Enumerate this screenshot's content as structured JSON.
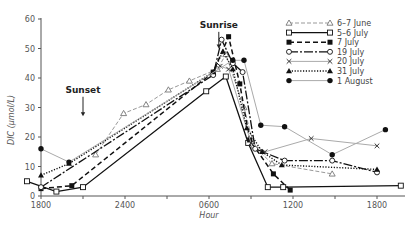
{
  "chart_data": {
    "type": "line",
    "title": "",
    "xlabel": "Hour",
    "ylabel": "DIC (µmol/L)",
    "ylim": [
      0,
      60
    ],
    "yticks": [
      0,
      10,
      20,
      30,
      40,
      50,
      60
    ],
    "x_unit": "hours elapsed since 1800",
    "xlim": [
      0,
      26
    ],
    "xticks": [
      {
        "x": 0,
        "label": "1800"
      },
      {
        "x": 3,
        "label": ""
      },
      {
        "x": 6,
        "label": "2400"
      },
      {
        "x": 9,
        "label": ""
      },
      {
        "x": 12,
        "label": "0600"
      },
      {
        "x": 15,
        "label": ""
      },
      {
        "x": 18,
        "label": "1200"
      },
      {
        "x": 21,
        "label": ""
      },
      {
        "x": 24,
        "label": "1800"
      }
    ],
    "grid": false,
    "legend_position": "upper right",
    "annotations": [
      {
        "text": "Sunset",
        "x": 3.0,
        "y_text": 35,
        "arrow_to": 27
      },
      {
        "text": "Sunrise",
        "x": 12.7,
        "y_text": 57,
        "arrow_to": 50
      }
    ],
    "series": [
      {
        "name": "6–7 June",
        "marker": "open-triangle",
        "line": "dashed-light",
        "color": "#999999",
        "x": [
          3.9,
          5.9,
          7.5,
          9.1,
          10.6,
          12.6,
          13.2,
          14.5,
          15.2,
          16.5,
          20.8
        ],
        "y": [
          14,
          28,
          31,
          36,
          39,
          43,
          48,
          30,
          17,
          11,
          7.5
        ]
      },
      {
        "name": "5–6 July",
        "marker": "open-square",
        "line": "solid",
        "color": "#111111",
        "x": [
          -1.0,
          1.1,
          3.0,
          11.8,
          13.2,
          14.8,
          16.2,
          17.3,
          25.7
        ],
        "y": [
          5,
          1.5,
          3,
          35.5,
          40.5,
          18,
          3,
          3,
          3.5
        ]
      },
      {
        "name": "7 July",
        "marker": "filled-square",
        "line": "dashed",
        "color": "#111111",
        "x": [
          0.0,
          2.2,
          12.3,
          13.4,
          14.2,
          14.9,
          16.6,
          17.8
        ],
        "y": [
          2.5,
          3.5,
          42,
          54,
          38,
          19,
          7.5,
          2
        ]
      },
      {
        "name": "19 July",
        "marker": "open-circle",
        "line": "long-dash",
        "color": "#111111",
        "x": [
          0.0,
          12.3,
          12.9,
          13.7,
          14.4,
          15.3,
          17.4,
          20.8,
          24.0
        ],
        "y": [
          3,
          41,
          53,
          45,
          42,
          16,
          12,
          12,
          8
        ]
      },
      {
        "name": "20 July",
        "marker": "cross",
        "line": "solid-light",
        "color": "#aaaaaa",
        "x": [
          12.8,
          13.4,
          15.0,
          16.0,
          19.3,
          24.0
        ],
        "y": [
          44,
          43,
          18,
          15,
          19.5,
          17
        ]
      },
      {
        "name": "31 July",
        "marker": "filled-triangle",
        "line": "dotted",
        "color": "#111111",
        "x": [
          0.0,
          2.0,
          12.3,
          13.0,
          13.7,
          14.7,
          15.8,
          17.2,
          24.0
        ],
        "y": [
          7,
          11,
          42,
          49,
          43,
          23,
          15,
          10.5,
          9
        ]
      },
      {
        "name": "1 August",
        "marker": "filled-circle",
        "line": "solid-light",
        "color": "#999999",
        "x": [
          0.0,
          2.0,
          13.7,
          14.5,
          15.7,
          17.4,
          20.8,
          24.6
        ],
        "y": [
          16,
          11.5,
          46,
          46,
          24,
          23.5,
          14,
          22.5
        ]
      }
    ]
  }
}
